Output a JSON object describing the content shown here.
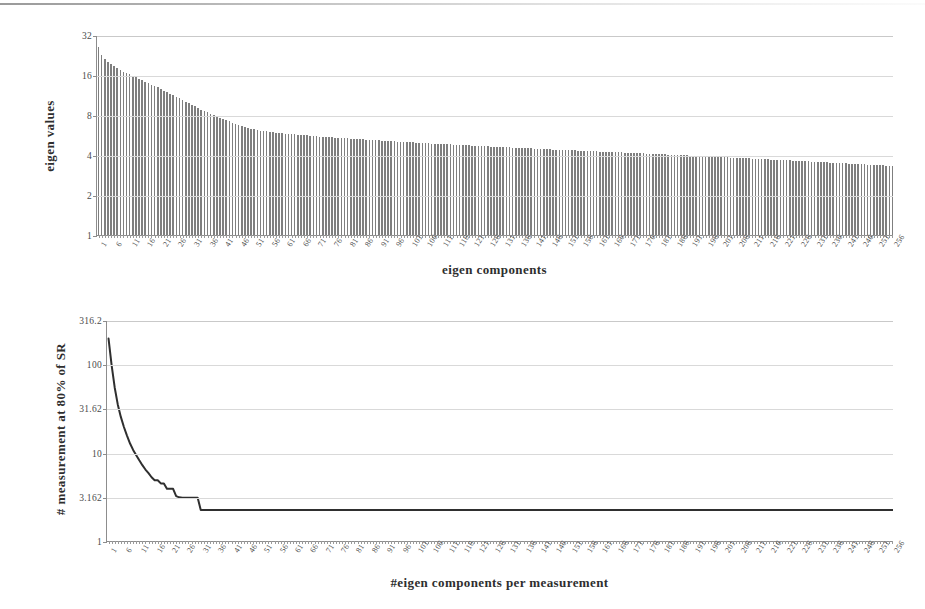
{
  "page": {
    "background": "#ffffff",
    "ink_color": "#3a3a3a",
    "bar_color": "#7f7f7f",
    "line_color": "#2f2f2f",
    "grid_color": "#d9d9d9",
    "axis_color": "#8d8d8d"
  },
  "chart_data": [
    {
      "id": "eigen-values-bar",
      "type": "bar",
      "title": "",
      "xlabel": "eigen components",
      "ylabel": "eigen values",
      "yscale": "log2",
      "ylim": [
        1,
        32
      ],
      "yticks": [
        "1",
        "2",
        "4",
        "8",
        "16",
        "32"
      ],
      "ytick_values": [
        1,
        2,
        4,
        8,
        16,
        32
      ],
      "grid": true,
      "legend": "none",
      "x_start": 1,
      "x_end": 256,
      "xtick_step": 5,
      "xticks": [
        "1",
        "6",
        "11",
        "16",
        "21",
        "26",
        "31",
        "36",
        "41",
        "46",
        "51",
        "56",
        "61",
        "66",
        "71",
        "76",
        "81",
        "86",
        "91",
        "96",
        "101",
        "106",
        "111",
        "116",
        "121",
        "126",
        "131",
        "136",
        "141",
        "146",
        "151",
        "156",
        "161",
        "166",
        "171",
        "176",
        "181",
        "186",
        "191",
        "196",
        "201",
        "206",
        "211",
        "216",
        "221",
        "226",
        "231",
        "236",
        "241",
        "246",
        "251",
        "256"
      ],
      "values": [
        26.0,
        22.5,
        21.0,
        20.0,
        19.3,
        18.6,
        18.0,
        17.5,
        17.0,
        16.6,
        16.2,
        15.8,
        15.4,
        15.0,
        14.6,
        14.2,
        13.9,
        13.5,
        13.2,
        12.9,
        12.6,
        12.2,
        11.9,
        11.6,
        11.3,
        11.0,
        10.7,
        10.4,
        10.1,
        9.8,
        9.55,
        9.3,
        9.05,
        8.8,
        8.6,
        8.4,
        8.2,
        8.0,
        7.8,
        7.6,
        7.45,
        7.3,
        7.15,
        7.0,
        6.88,
        6.76,
        6.64,
        6.53,
        6.42,
        6.32,
        6.24,
        6.17,
        6.11,
        6.06,
        6.02,
        5.98,
        5.94,
        5.9,
        5.86,
        5.83,
        5.8,
        5.77,
        5.74,
        5.71,
        5.68,
        5.66,
        5.63,
        5.61,
        5.58,
        5.56,
        5.54,
        5.51,
        5.49,
        5.47,
        5.45,
        5.43,
        5.41,
        5.39,
        5.37,
        5.35,
        5.33,
        5.31,
        5.29,
        5.27,
        5.26,
        5.24,
        5.22,
        5.2,
        5.18,
        5.17,
        5.15,
        5.13,
        5.12,
        5.1,
        5.08,
        5.07,
        5.05,
        5.03,
        5.02,
        5.0,
        4.99,
        4.97,
        4.96,
        4.94,
        4.93,
        4.91,
        4.9,
        4.88,
        4.87,
        4.86,
        4.84,
        4.83,
        4.81,
        4.8,
        4.79,
        4.77,
        4.76,
        4.75,
        4.73,
        4.72,
        4.71,
        4.69,
        4.68,
        4.67,
        4.66,
        4.64,
        4.63,
        4.62,
        4.61,
        4.59,
        4.58,
        4.57,
        4.56,
        4.55,
        4.53,
        4.52,
        4.51,
        4.5,
        4.49,
        4.48,
        4.47,
        4.45,
        4.44,
        4.43,
        4.42,
        4.41,
        4.4,
        4.39,
        4.38,
        4.37,
        4.36,
        4.35,
        4.34,
        4.33,
        4.32,
        4.31,
        4.3,
        4.29,
        4.28,
        4.27,
        4.26,
        4.25,
        4.24,
        4.23,
        4.22,
        4.21,
        4.2,
        4.19,
        4.18,
        4.17,
        4.16,
        4.15,
        4.14,
        4.13,
        4.12,
        4.11,
        4.1,
        4.09,
        4.08,
        4.07,
        4.06,
        4.05,
        4.04,
        4.03,
        4.02,
        4.01,
        4.0,
        3.99,
        3.98,
        3.97,
        3.96,
        3.95,
        3.94,
        3.93,
        3.92,
        3.91,
        3.9,
        3.89,
        3.88,
        3.87,
        3.86,
        3.85,
        3.84,
        3.83,
        3.82,
        3.81,
        3.8,
        3.79,
        3.78,
        3.77,
        3.76,
        3.75,
        3.74,
        3.73,
        3.72,
        3.71,
        3.7,
        3.69,
        3.68,
        3.67,
        3.66,
        3.65,
        3.64,
        3.63,
        3.62,
        3.61,
        3.6,
        3.59,
        3.58,
        3.57,
        3.56,
        3.55,
        3.54,
        3.53,
        3.52,
        3.51,
        3.5,
        3.49,
        3.48,
        3.47,
        3.46,
        3.45,
        3.44,
        3.43,
        3.42,
        3.41,
        3.4,
        3.39,
        3.38,
        3.37,
        3.36,
        3.35,
        3.34,
        3.33,
        3.32,
        3.31
      ]
    },
    {
      "id": "measurements-line",
      "type": "line",
      "title": "",
      "xlabel": "#eigen components per measurement",
      "ylabel": "# measurement at 80% of SR",
      "yscale": "log10",
      "ylim": [
        1,
        316.2
      ],
      "yticks": [
        "1",
        "3.162",
        "10",
        "31.62",
        "100",
        "316.2"
      ],
      "ytick_values": [
        1,
        3.162,
        10,
        31.62,
        100,
        316.2
      ],
      "grid": true,
      "legend": "none",
      "x_start": 1,
      "x_end": 256,
      "xtick_step": 5,
      "xticks": [
        "1",
        "6",
        "11",
        "16",
        "21",
        "26",
        "31",
        "36",
        "41",
        "46",
        "51",
        "56",
        "61",
        "66",
        "71",
        "76",
        "81",
        "86",
        "91",
        "96",
        "101",
        "106",
        "111",
        "116",
        "121",
        "126",
        "131",
        "136",
        "141",
        "146",
        "151",
        "156",
        "161",
        "166",
        "171",
        "176",
        "181",
        "186",
        "191",
        "196",
        "201",
        "206",
        "211",
        "216",
        "221",
        "226",
        "231",
        "236",
        "241",
        "246",
        "251",
        "256"
      ],
      "values": [
        200.0,
        100.0,
        56.0,
        36.0,
        26.0,
        20.0,
        16.0,
        13.0,
        11.0,
        9.6,
        8.4,
        7.4,
        6.6,
        6.0,
        5.4,
        5.0,
        5.0,
        4.6,
        4.6,
        4.0,
        4.0,
        4.0,
        3.3,
        3.2,
        3.16,
        3.16,
        3.16,
        3.16,
        3.16,
        3.16,
        2.3,
        2.3,
        2.3,
        2.3,
        2.3,
        2.3,
        2.3,
        2.3,
        2.3,
        2.3,
        2.3,
        2.3,
        2.3,
        2.3,
        2.3,
        2.3,
        2.3,
        2.3,
        2.3,
        2.3,
        2.3,
        2.3,
        2.3,
        2.3,
        2.3,
        2.3,
        2.3,
        2.3,
        2.3,
        2.3,
        2.3,
        2.3,
        2.3,
        2.3,
        2.3,
        2.3,
        2.3,
        2.3,
        2.3,
        2.3,
        2.3,
        2.3,
        2.3,
        2.3,
        2.3,
        2.3,
        2.3,
        2.3,
        2.3,
        2.3,
        2.3,
        2.3,
        2.3,
        2.3,
        2.3,
        2.3,
        2.3,
        2.3,
        2.3,
        2.3,
        2.3,
        2.3,
        2.3,
        2.3,
        2.3,
        2.3,
        2.3,
        2.3,
        2.3,
        2.3,
        2.3,
        2.3,
        2.3,
        2.3,
        2.3,
        2.3,
        2.3,
        2.3,
        2.3,
        2.3,
        2.3,
        2.3,
        2.3,
        2.3,
        2.3,
        2.3,
        2.3,
        2.3,
        2.3,
        2.3,
        2.3,
        2.3,
        2.3,
        2.3,
        2.3,
        2.3,
        2.3,
        2.3,
        2.3,
        2.3,
        2.3,
        2.3,
        2.3,
        2.3,
        2.3,
        2.3,
        2.3,
        2.3,
        2.3,
        2.3,
        2.3,
        2.3,
        2.3,
        2.3,
        2.3,
        2.3,
        2.3,
        2.3,
        2.3,
        2.3,
        2.3,
        2.3,
        2.3,
        2.3,
        2.3,
        2.3,
        2.3,
        2.3,
        2.3,
        2.3,
        2.3,
        2.3,
        2.3,
        2.3,
        2.3,
        2.3,
        2.3,
        2.3,
        2.3,
        2.3,
        2.3,
        2.3,
        2.3,
        2.3,
        2.3,
        2.3,
        2.3,
        2.3,
        2.3,
        2.3,
        2.3,
        2.3,
        2.3,
        2.3,
        2.3,
        2.3,
        2.3,
        2.3,
        2.3,
        2.3,
        2.3,
        2.3,
        2.3,
        2.3,
        2.3,
        2.3,
        2.3,
        2.3,
        2.3,
        2.3,
        2.3,
        2.3,
        2.3,
        2.3,
        2.3,
        2.3,
        2.3,
        2.3,
        2.3,
        2.3,
        2.3,
        2.3,
        2.3,
        2.3,
        2.3,
        2.3,
        2.3,
        2.3,
        2.3,
        2.3,
        2.3,
        2.3,
        2.3,
        2.3,
        2.3,
        2.3,
        2.3,
        2.3,
        2.3,
        2.3,
        2.3,
        2.3,
        2.3,
        2.3,
        2.3,
        2.3,
        2.3,
        2.3,
        2.3,
        2.3,
        2.3,
        2.3,
        2.3,
        2.3,
        2.3,
        2.3,
        2.3,
        2.3,
        2.3,
        2.3,
        2.3,
        2.3,
        2.3,
        2.3,
        2.3,
        2.3
      ]
    }
  ]
}
